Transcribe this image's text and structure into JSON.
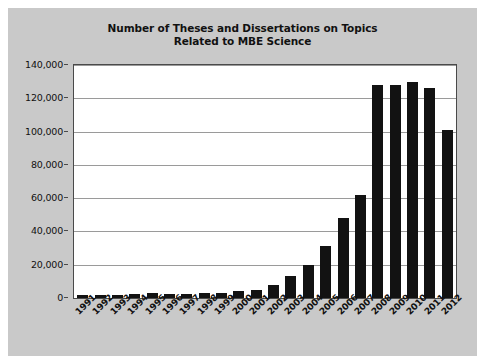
{
  "chart_data": {
    "type": "bar",
    "title": "Number of Theses and Dissertations on Topics Related to MBE Science",
    "title_line1": "Number of Theses and Dissertations on Topics",
    "title_line2": "Related to MBE Science",
    "xlabel": "",
    "ylabel": "",
    "ylim": [
      0,
      140000
    ],
    "ytick_step": 20000,
    "grid": true,
    "legend": null,
    "bar_color": "#121212",
    "plot_background": "#ffffff",
    "figure_background": "#c9c9c9",
    "categories": [
      "1991",
      "1992",
      "1993",
      "1994",
      "1995",
      "1996",
      "1997",
      "1998",
      "1999",
      "2000",
      "2001",
      "2002",
      "2003",
      "2004",
      "2005",
      "2006",
      "2007",
      "2008",
      "2009",
      "2010",
      "2011",
      "2012"
    ],
    "values": [
      2000,
      2000,
      1800,
      2500,
      3000,
      2500,
      2500,
      2800,
      3000,
      4000,
      5000,
      8000,
      13000,
      20000,
      31000,
      48000,
      62000,
      128000,
      128000,
      130000,
      126000,
      101000
    ],
    "ytick_labels": [
      "0",
      "20,000",
      "40,000",
      "60,000",
      "80,000",
      "100,000",
      "120,000",
      "140,000"
    ],
    "ytick_values": [
      0,
      20000,
      40000,
      60000,
      80000,
      100000,
      120000,
      140000
    ]
  }
}
